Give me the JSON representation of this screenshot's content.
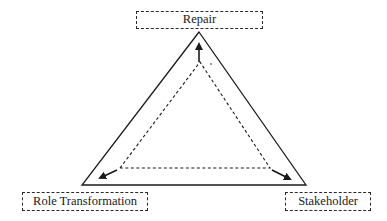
{
  "diagram": {
    "type": "triangle-cycle",
    "nodes": [
      {
        "id": "repair",
        "label": "Repair",
        "position": "top"
      },
      {
        "id": "role_transformation",
        "label": "Role Transformation",
        "position": "bottom-left"
      },
      {
        "id": "stakeholder",
        "label": "Stakeholder",
        "position": "bottom-right"
      }
    ],
    "edges": [
      {
        "from": "stakeholder",
        "to": "role_transformation",
        "style": "dashed",
        "arrow": "toward bottom-left"
      },
      {
        "from": "role_transformation",
        "to": "repair",
        "style": "dashed",
        "arrow": "upward at apex"
      },
      {
        "from": "repair",
        "to": "stakeholder",
        "style": "dashed",
        "arrow": "toward bottom-right"
      }
    ],
    "outer_shape": "solid triangle",
    "inner_shape": "dashed triangle with arrows",
    "colors": {
      "line": "#1a1a1a",
      "background": "#ffffff"
    }
  }
}
